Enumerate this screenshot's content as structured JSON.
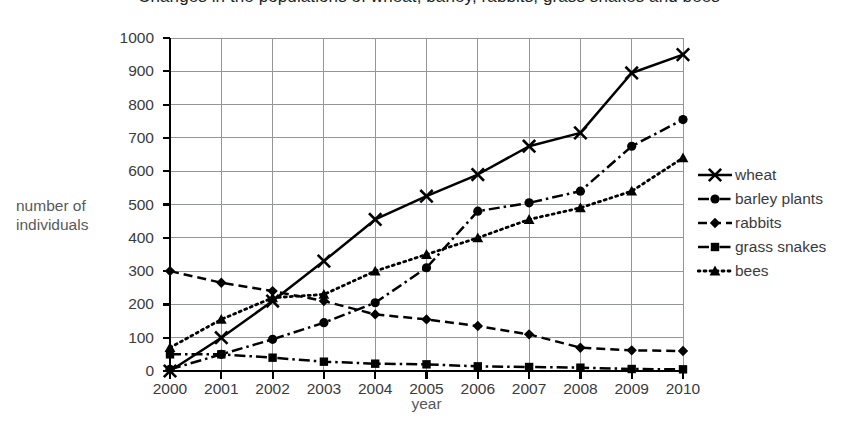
{
  "chart_data": {
    "type": "line",
    "title": "Changes in the populations of wheat, barley, rabbits, grass snakes and bees",
    "xlabel": "year",
    "ylabel": "number of individuals",
    "ylabel_lines": [
      "number of",
      "individuals"
    ],
    "categories": [
      "2000",
      "2001",
      "2002",
      "2003",
      "2004",
      "2005",
      "2006",
      "2007",
      "2008",
      "2009",
      "2010"
    ],
    "x": [
      2000,
      2001,
      2002,
      2003,
      2004,
      2005,
      2006,
      2007,
      2008,
      2009,
      2010
    ],
    "xlim": [
      2000,
      2010
    ],
    "ylim": [
      0,
      1000
    ],
    "ytick_labels": [
      "1000",
      "900",
      "800",
      "700",
      "600",
      "500",
      "400",
      "300",
      "200",
      "100",
      "0"
    ],
    "yticks": [
      1000,
      900,
      800,
      700,
      600,
      500,
      400,
      300,
      200,
      100,
      0
    ],
    "ytick_step": 100,
    "grid": true,
    "grid_color": "#939598",
    "legend_position": "right",
    "series": [
      {
        "name": "wheat",
        "marker": "x",
        "dash": "solid",
        "color": "#000000",
        "values": [
          0,
          100,
          210,
          330,
          455,
          525,
          590,
          675,
          715,
          895,
          950
        ]
      },
      {
        "name": "barley plants",
        "marker": "circle",
        "dash": "dash-dot",
        "color": "#000000",
        "values": [
          5,
          50,
          95,
          145,
          205,
          310,
          480,
          505,
          540,
          675,
          755
        ]
      },
      {
        "name": "rabbits",
        "marker": "diamond",
        "dash": "dashed",
        "color": "#000000",
        "values": [
          300,
          265,
          240,
          210,
          170,
          155,
          135,
          110,
          70,
          62,
          60
        ]
      },
      {
        "name": "grass snakes",
        "marker": "square",
        "dash": "dash-dot",
        "color": "#000000",
        "values": [
          50,
          50,
          40,
          28,
          22,
          20,
          14,
          12,
          10,
          6,
          5
        ]
      },
      {
        "name": "bees",
        "marker": "triangle",
        "dash": "dotted",
        "color": "#000000",
        "values": [
          70,
          155,
          220,
          230,
          300,
          350,
          400,
          455,
          490,
          540,
          640
        ]
      }
    ]
  },
  "axis": {
    "y_title_line1": "number of",
    "y_title_line2": "individuals",
    "x_title": "year"
  },
  "legend": {
    "items": [
      {
        "label": "wheat",
        "marker": "x",
        "dash": "solid"
      },
      {
        "label": "barley plants",
        "marker": "circle",
        "dash": "dash-dot"
      },
      {
        "label": "rabbits",
        "marker": "diamond",
        "dash": "dashed"
      },
      {
        "label": "grass snakes",
        "marker": "square",
        "dash": "dash-dot"
      },
      {
        "label": "bees",
        "marker": "triangle",
        "dash": "dotted"
      }
    ]
  }
}
